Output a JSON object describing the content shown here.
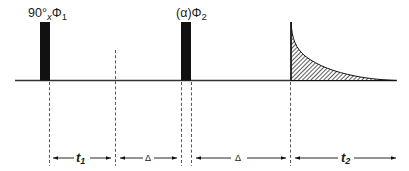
{
  "diagram": {
    "pulses": [
      {
        "id": "pulse-1",
        "label_main": "90°",
        "label_sub": "x",
        "label_phase": "Φ",
        "label_phase_sub": "1"
      },
      {
        "id": "pulse-2",
        "label_main": "(α)",
        "label_phase": "Φ",
        "label_phase_sub": "2"
      }
    ],
    "signal": {
      "type": "FID",
      "fill": "hatched"
    },
    "intervals": [
      {
        "id": "t1",
        "label": "t",
        "sub": "1"
      },
      {
        "id": "delta-1",
        "label": "Δ"
      },
      {
        "id": "delta-2",
        "label": "Δ"
      },
      {
        "id": "t2",
        "label": "t",
        "sub": "2"
      }
    ],
    "colors": {
      "ink": "#111111",
      "baseline": "#333333",
      "hatch": "#555555"
    }
  }
}
